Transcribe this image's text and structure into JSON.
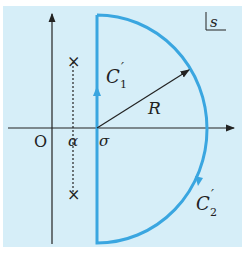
{
  "diagram": {
    "background": "#d6eef8",
    "contour_color": "#3aa6e0",
    "axis_color": "#222222",
    "plane_label": "s",
    "origin_label": "O",
    "alpha_label": "α",
    "sigma_label": "σ",
    "radius_label": "R",
    "c1_label": "C",
    "c1_sup": "′",
    "c1_sub": "1",
    "c2_label": "C",
    "c2_sup": "′",
    "c2_sub": "2",
    "pole_marker": "×"
  }
}
